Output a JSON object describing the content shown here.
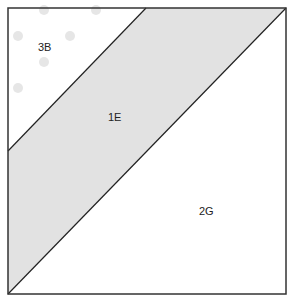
{
  "diagram": {
    "type": "quilt-block-pattern",
    "pieces": [
      {
        "id": "3B",
        "label": "3B",
        "shape": "triangle",
        "fill": "#ffffff",
        "pattern": "polka-dots"
      },
      {
        "id": "1E",
        "label": "1E",
        "shape": "parallelogram-strip",
        "fill": "#e2e2e2"
      },
      {
        "id": "2G",
        "label": "2G",
        "shape": "triangle",
        "fill": "#ffffff"
      }
    ],
    "colors": {
      "border": "#333333",
      "strip": "#e2e2e2",
      "dot": "#e6e6e6",
      "background": "#ffffff"
    }
  }
}
